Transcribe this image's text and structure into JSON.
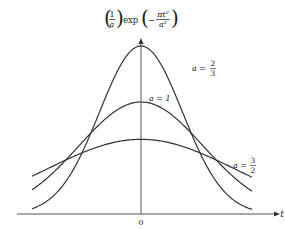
{
  "chart_data": {
    "type": "line",
    "title": "",
    "ylabel": "(1/a) exp(−πt²/a²)",
    "ylabel_parts": {
      "frac1_num": "1",
      "frac1_den": "a",
      "exp": "exp",
      "minus": "−",
      "frac2_num": "πt²",
      "frac2_den": "a²"
    },
    "xlabel": "t",
    "x_tick_labels": [
      "0"
    ],
    "grid": false,
    "legend": "inline labels",
    "xlim": [
      -0.7,
      0.71
    ],
    "ylim": [
      0,
      1.55
    ],
    "series": [
      {
        "name": "a = 2/3",
        "a": 0.6667,
        "peak": 1.5,
        "label_num": "2",
        "label_den": "3"
      },
      {
        "name": "a = 1",
        "a": 1.0,
        "peak": 1.0,
        "label_text": "a = 1"
      },
      {
        "name": "a = 3/2",
        "a": 1.5,
        "peak": 0.6667,
        "label_num": "3",
        "label_den": "2"
      }
    ],
    "x_samples": [
      -0.7,
      -0.6,
      -0.5,
      -0.4,
      -0.3,
      -0.2,
      -0.1,
      0,
      0.1,
      0.2,
      0.3,
      0.4,
      0.5,
      0.6,
      0.7
    ],
    "values": {
      "a=2/3": [
        0.047,
        0.119,
        0.257,
        0.484,
        0.792,
        1.132,
        1.398,
        1.5,
        1.398,
        1.132,
        0.792,
        0.484,
        0.257,
        0.119,
        0.047
      ],
      "a=1": [
        0.214,
        0.322,
        0.456,
        0.605,
        0.754,
        0.882,
        0.969,
        1.0,
        0.969,
        0.882,
        0.754,
        0.605,
        0.456,
        0.322,
        0.214
      ],
      "a=3/2": [
        0.337,
        0.401,
        0.471,
        0.532,
        0.585,
        0.63,
        0.658,
        0.667,
        0.658,
        0.63,
        0.585,
        0.532,
        0.471,
        0.401,
        0.337
      ]
    }
  },
  "labels": {
    "a_eq": "a =",
    "a1": "a = 1",
    "x_axis": "t",
    "origin": "0"
  },
  "colors": {
    "curve": "#333333",
    "axis": "#555555",
    "text": "#222222"
  }
}
